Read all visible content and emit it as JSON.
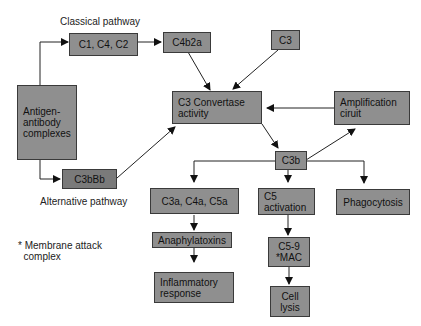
{
  "diagram": {
    "labels": {
      "classical_pathway": "Classical pathway",
      "alternative_pathway": "Alternative pathway",
      "footnote": "* Membrane attack\n  complex"
    },
    "nodes": {
      "antigen_antibody": "Antigen-\nantibody\ncomplexes",
      "c1c4c2": "C1, C4, C2",
      "c4b2a": "C4b2a",
      "c3": "C3",
      "c3_convertase": "C3 Convertase\nactivity",
      "amplification": "Amplification\nciruit",
      "c3bbb": "C3bBb",
      "c3b": "C3b",
      "c3a_c4a_c5a": "C3a, C4a, C5a",
      "c5_activation": "C5\nactivation",
      "phagocytosis": "Phagocytosis",
      "anaphylatoxins": "Anaphylatoxins",
      "c5_9_mac": "C5-9\n*MAC",
      "inflammatory": "Inflammatory\nresponse",
      "cell_lysis": "Cell\nlysis"
    },
    "colors": {
      "box_fill": "#8f8f8f",
      "box_fill_dark": "#7a7a7a",
      "line": "#1a1a1a"
    }
  }
}
